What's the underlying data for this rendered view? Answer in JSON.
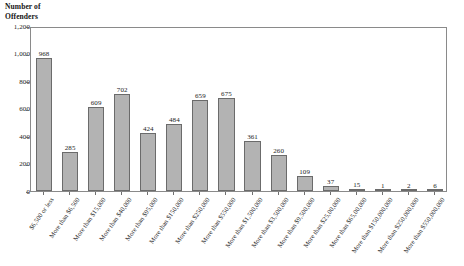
{
  "chart_data": {
    "type": "bar",
    "title": "",
    "subtitle": "",
    "ylabel": "Number of\nOffenders",
    "xlabel": "",
    "ylim": [
      0,
      1200
    ],
    "grid": false,
    "legend": null,
    "y_ticks": [
      "0",
      "200",
      "400",
      "600",
      "800",
      "1,000",
      "1,200"
    ],
    "y_tick_values": [
      0,
      200,
      400,
      600,
      800,
      1000,
      1200
    ],
    "categories": [
      "$6,500 or less",
      "More than $6,500",
      "More than $15,000",
      "More than $40,000",
      "More than $95,000",
      "More than $150,000",
      "More than $250,000",
      "More than $550,000",
      "More than $1,500,000",
      "More than $3,500,000",
      "More than $9,500,000",
      "More than $25,00,000",
      "More than $65,00,000",
      "More than $150,000,000",
      "More than $250,000,000",
      "More than $550,000,000"
    ],
    "values": [
      968,
      285,
      609,
      702,
      424,
      484,
      659,
      675,
      361,
      260,
      109,
      37,
      15,
      1,
      2,
      6
    ],
    "value_labels": [
      "968",
      "285",
      "609",
      "702",
      "424",
      "484",
      "659",
      "675",
      "361",
      "260",
      "109",
      "37",
      "15",
      "1",
      "2",
      "6"
    ],
    "bar_color": "#b3b3b3",
    "bar_border_color": "#6b6b6b",
    "frame_color": "#8a8a8a",
    "text_color": "#1c1c1c"
  }
}
